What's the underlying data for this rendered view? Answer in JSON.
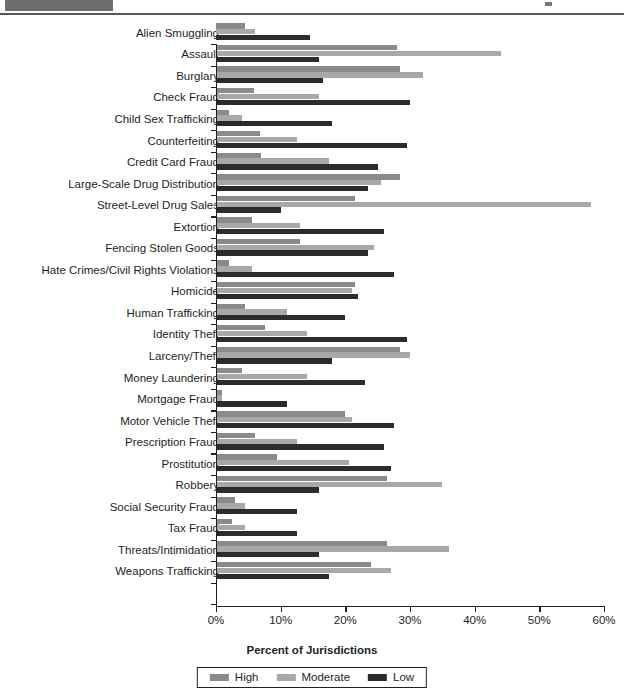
{
  "header": {
    "block_label": "",
    "mark_label": ""
  },
  "chart_data": {
    "type": "bar",
    "orientation": "horizontal",
    "title": "",
    "xlabel": "Percent of Jurisdictions",
    "ylabel": "",
    "xlim": [
      0,
      60
    ],
    "xtick_labels": [
      "0%",
      "10%",
      "20%",
      "30%",
      "40%",
      "50%",
      "60%"
    ],
    "xticks": [
      0,
      10,
      20,
      30,
      40,
      50,
      60
    ],
    "grid": false,
    "legend_position": "bottom-center",
    "colors": {
      "high": "#8a8a8a",
      "moderate": "#a8a8a8",
      "low": "#2b2b2b",
      "axis": "#231f20",
      "header_block": "#6e6e6e"
    },
    "categories": [
      "Alien Smuggling",
      "Assault",
      "Burglary",
      "Check Fraud",
      "Child Sex Trafficking",
      "Counterfeiting",
      "Credit Card Fraud",
      "Large-Scale Drug Distribution",
      "Street-Level Drug Sales",
      "Extortion",
      "Fencing Stolen Goods",
      "Hate Crimes/Civil Rights Violations",
      "Homicide",
      "Human Trafficking",
      "Identity Theft",
      "Larceny/Theft",
      "Money Laundering",
      "Mortgage Fraud",
      "Motor Vehicle Theft",
      "Prescription Fraud",
      "Prostitution",
      "Robbery",
      "Social Security Fraud",
      "Tax Fraud",
      "Threats/Intimidation",
      "Weapons Trafficking"
    ],
    "series": [
      {
        "name": "High",
        "values": [
          4.5,
          28.0,
          28.5,
          5.8,
          2.0,
          6.8,
          7.0,
          28.5,
          21.5,
          5.5,
          13.0,
          2.0,
          21.5,
          4.5,
          7.5,
          28.5,
          4.0,
          1.0,
          20.0,
          6.0,
          9.5,
          26.5,
          3.0,
          2.5,
          26.5,
          24.0
        ]
      },
      {
        "name": "Moderate",
        "values": [
          6.0,
          44.0,
          32.0,
          16.0,
          4.0,
          12.5,
          17.5,
          25.5,
          58.0,
          13.0,
          24.5,
          5.5,
          21.0,
          11.0,
          14.0,
          30.0,
          14.0,
          1.0,
          21.0,
          12.5,
          20.5,
          35.0,
          4.5,
          4.5,
          36.0,
          27.0
        ]
      },
      {
        "name": "Low",
        "values": [
          14.5,
          16.0,
          16.5,
          30.0,
          18.0,
          29.5,
          25.0,
          23.5,
          10.0,
          26.0,
          23.5,
          27.5,
          22.0,
          20.0,
          29.5,
          18.0,
          23.0,
          11.0,
          27.5,
          26.0,
          27.0,
          16.0,
          12.5,
          12.5,
          16.0,
          17.5
        ]
      }
    ]
  }
}
